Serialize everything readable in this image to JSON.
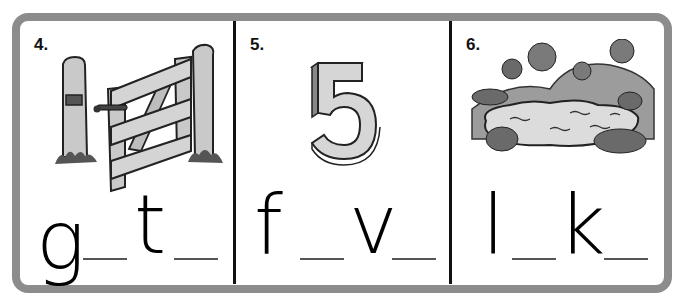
{
  "worksheet": {
    "frame_color": "#8c8c8c",
    "panels": [
      {
        "number": "4.",
        "picture": "gate-icon",
        "word_parts": [
          "g",
          "_",
          "t",
          "_"
        ],
        "letters": {
          "first": "g",
          "second": "t"
        }
      },
      {
        "number": "5.",
        "picture": "number-five-icon",
        "word_parts": [
          "f",
          "_",
          "v",
          "_"
        ],
        "letters": {
          "first": "f",
          "second": "v"
        }
      },
      {
        "number": "6.",
        "picture": "lake-icon",
        "word_parts": [
          "l",
          "_",
          "k",
          "_"
        ],
        "letters": {
          "first": "l",
          "second": "k"
        }
      }
    ]
  }
}
